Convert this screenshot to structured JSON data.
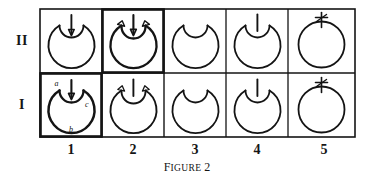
{
  "figure": {
    "caption_prefix": "F",
    "caption_rest": "IGURE",
    "caption_number": "2",
    "caption_full": "FIGURE 2"
  },
  "grid": {
    "row_labels": [
      {
        "id": "row-II",
        "label": "II"
      },
      {
        "id": "row-I",
        "label": "I"
      }
    ],
    "column_labels": [
      {
        "id": "col-1",
        "label": "1"
      },
      {
        "id": "col-2",
        "label": "2"
      },
      {
        "id": "col-3",
        "label": "3"
      },
      {
        "id": "col-4",
        "label": "4"
      },
      {
        "id": "col-5",
        "label": "5"
      }
    ]
  },
  "cells": {
    "II-1": {
      "name": "cell-II-1",
      "glyph": "circle-with-inner-loop-and-down-arrow",
      "emphasized": false
    },
    "II-2": {
      "name": "cell-II-2",
      "glyph": "circle-with-inner-loop-double-arrowheads-and-down-arrow",
      "emphasized": true
    },
    "II-3": {
      "name": "cell-II-3",
      "glyph": "circle-with-inner-loop",
      "emphasized": false
    },
    "II-4": {
      "name": "cell-II-4",
      "glyph": "circle-with-inner-loop-and-vertical-line",
      "emphasized": false
    },
    "II-5": {
      "name": "cell-II-5",
      "glyph": "circle-with-asterisk-mark",
      "emphasized": false
    },
    "I-1": {
      "name": "cell-I-1",
      "glyph": "circle-with-inner-loop-and-down-arrow-labeled",
      "emphasized": true
    },
    "I-2": {
      "name": "cell-I-2",
      "glyph": "circle-with-inner-loop-double-arrowheads-and-vertical-line",
      "emphasized": false
    },
    "I-3": {
      "name": "cell-I-3",
      "glyph": "circle-with-inner-loop",
      "emphasized": false
    },
    "I-4": {
      "name": "cell-I-4",
      "glyph": "circle-with-inner-loop-and-vertical-line",
      "emphasized": false
    },
    "I-5": {
      "name": "cell-I-5",
      "glyph": "circle-with-asterisk-mark",
      "emphasized": false
    }
  },
  "annotations": {
    "a": "a",
    "b": "b",
    "c": "c"
  },
  "colors": {
    "ink": "#141414",
    "paper": "#ffffff"
  }
}
